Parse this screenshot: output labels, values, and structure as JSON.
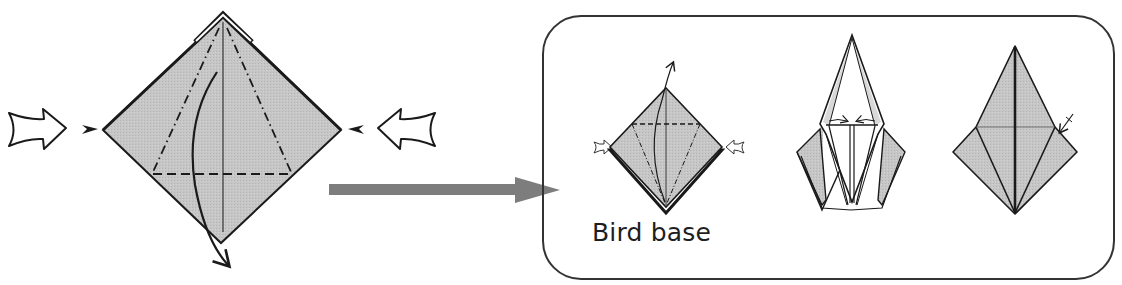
{
  "figure": {
    "title": "Bird base",
    "colors": {
      "paper": "#c4c4c4",
      "paper_white": "#ffffff",
      "line": "#1a1a1a",
      "arrow_fill": "#7d7d7d",
      "frame": "#333333"
    },
    "steps": [
      {
        "id": "step-1",
        "description": "Squash fold: push sides in along mountain and valley folds, lift bottom flap upward",
        "symbols": [
          "push-arrow-left",
          "push-arrow-right",
          "valley-fold-line",
          "mountain-fold-line",
          "fold-over-arrow"
        ]
      },
      {
        "id": "step-2",
        "description": "Repeat petal fold on back",
        "symbols": [
          "push-arrow-left",
          "push-arrow-right",
          "valley-fold-line",
          "mountain-fold-line",
          "fold-over-arrow"
        ]
      },
      {
        "id": "step-3",
        "description": "Inner flaps folded toward center",
        "symbols": [
          "fold-in-arrow-left",
          "fold-in-arrow-right"
        ]
      },
      {
        "id": "step-4",
        "description": "Completed bird base",
        "symbols": [
          "crease-arrow"
        ]
      }
    ],
    "transition_arrow": "step-arrow-right"
  }
}
